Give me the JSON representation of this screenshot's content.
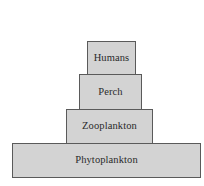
{
  "diagram": {
    "type": "food-pyramid",
    "levels": [
      {
        "label": "Humans",
        "rank": 4
      },
      {
        "label": "Perch",
        "rank": 3
      },
      {
        "label": "Zooplankton",
        "rank": 2
      },
      {
        "label": "Phytoplankton",
        "rank": 1
      }
    ],
    "colors": {
      "fill": "#d3d3d3",
      "border": "#5a5a5a",
      "text": "#2a2a2a"
    }
  }
}
